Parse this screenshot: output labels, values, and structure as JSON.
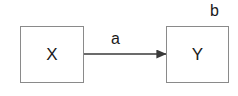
{
  "diagram": {
    "title": "",
    "background_color": "#ffffff",
    "stroke_color": "#8a8a8a",
    "text_color": "#1a1a1a",
    "arrow_color": "#3a3a3a"
  },
  "nodes": [
    {
      "id": "x",
      "label": "X",
      "shape": "rectangle",
      "x": 20,
      "y": 26,
      "width": 64,
      "height": 57
    },
    {
      "id": "y",
      "label": "Y",
      "shape": "rectangle",
      "x": 166,
      "y": 26,
      "width": 63,
      "height": 57
    }
  ],
  "edges": [
    {
      "id": "x-to-y",
      "label": "a",
      "from": "x",
      "to": "y",
      "arrowhead": "filled-triangle",
      "x1": 84,
      "y1": 54,
      "x2": 166,
      "y2": 54
    }
  ],
  "annotations": [
    {
      "id": "b",
      "label": "b",
      "x": 210,
      "y": 3
    }
  ]
}
